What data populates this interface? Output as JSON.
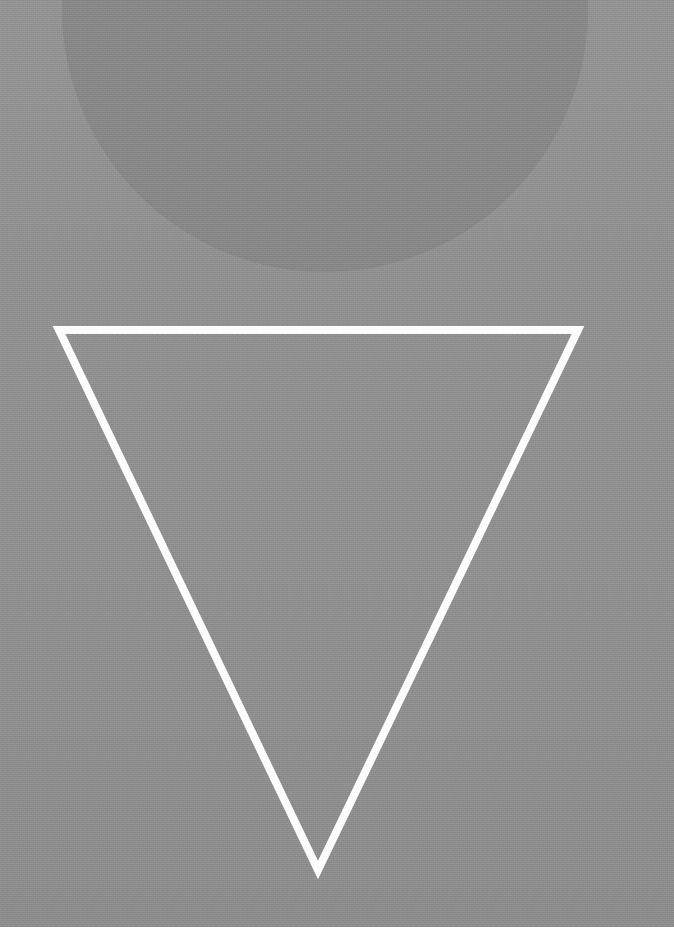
{
  "artwork": {
    "title": "Inverted Triangle over Disc",
    "medium": "flat-color geometric composition",
    "width": 674,
    "height": 927,
    "orientation": "portrait"
  },
  "palette": {
    "background": "#8e8e8e",
    "disc_fill": "#868686",
    "triangle_stroke": "#fdfdfd",
    "triangle_fill": "none"
  },
  "shapes": [
    {
      "id": "background-field",
      "name": "background-field",
      "kind": "rectangle",
      "fill": "#8e8e8e",
      "x": 0,
      "y": 0,
      "width": 674,
      "height": 927
    },
    {
      "id": "disc",
      "name": "disc",
      "kind": "circle",
      "fill": "#868686",
      "center_x": 325,
      "center_y": 9,
      "radius": 263,
      "clipped_edge": "top"
    },
    {
      "id": "inverted-triangle",
      "name": "inverted-triangle",
      "kind": "triangle-outline",
      "stroke": "#fdfdfd",
      "stroke_width": 8,
      "fill": "none",
      "direction": "pointing-down",
      "points": "59,330 578,330 318,870",
      "vertices": [
        {
          "label": "top-left",
          "x": 59,
          "y": 330
        },
        {
          "label": "top-right",
          "x": 578,
          "y": 330
        },
        {
          "label": "bottom-apex",
          "x": 318,
          "y": 870
        }
      ]
    }
  ],
  "texture": {
    "grain": "fine film grain",
    "banding": "subtle vertical scanline banding"
  }
}
